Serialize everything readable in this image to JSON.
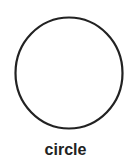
{
  "shape": {
    "type": "circle",
    "stroke": "#222222",
    "fill": "#ffffff"
  },
  "label": "circle"
}
